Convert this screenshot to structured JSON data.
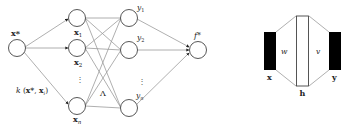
{
  "left_diagram": {
    "input_node": {
      "label": "x*"
    },
    "x_nodes": [
      {
        "label": "x",
        "sub": "1"
      },
      {
        "label": "x",
        "sub": "2"
      },
      {
        "label": "x",
        "sub": "n"
      }
    ],
    "x_ellipsis": "⋮",
    "y_nodes": [
      {
        "label": "y",
        "sub": "1"
      },
      {
        "label": "y",
        "sub": "2"
      },
      {
        "label": "y",
        "sub": "n"
      }
    ],
    "y_ellipsis": "⋮",
    "output_node": {
      "label": "f*"
    },
    "kernel_label": "k (x*, xᵢ)",
    "kernel_label_parts": {
      "k": "k",
      "open": " (",
      "xstar": "x*",
      "comma": ", ",
      "xi": "x",
      "xi_sub": "i",
      "close": ")"
    },
    "lambda_label": "Λ"
  },
  "right_diagram": {
    "x_label": "x",
    "h_label": "h",
    "y_label": "y",
    "w_label": "w",
    "v_label": "v"
  },
  "colors": {
    "edge": "#9a9a9a",
    "node_stroke": "#444444",
    "bar_fill": "#000000"
  }
}
